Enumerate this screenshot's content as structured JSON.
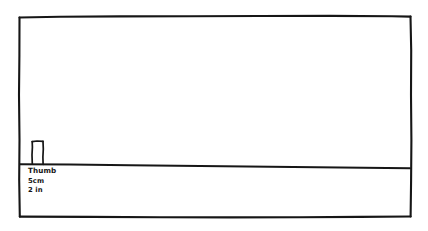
{
  "drawing": {
    "title": "Thumb scale sketch",
    "background_color": "#ffffff",
    "ink_color": "#161616",
    "style": "hand-drawn whiteboard sketch"
  },
  "frame": {
    "name": "outer-border-rectangle",
    "x": 19,
    "y": 16,
    "width": 392,
    "height": 201
  },
  "ground_line": {
    "name": "ground-baseline",
    "x_start": 20,
    "y_start": 164,
    "x_end": 410,
    "y_end": 168
  },
  "thumb_object": {
    "name": "thumb-rectangle",
    "x": 32,
    "y": 141,
    "width": 11,
    "height": 23
  },
  "labels": {
    "object_name": "Thumb",
    "metric_measure": "5cm",
    "imperial_measure": "2 in"
  }
}
